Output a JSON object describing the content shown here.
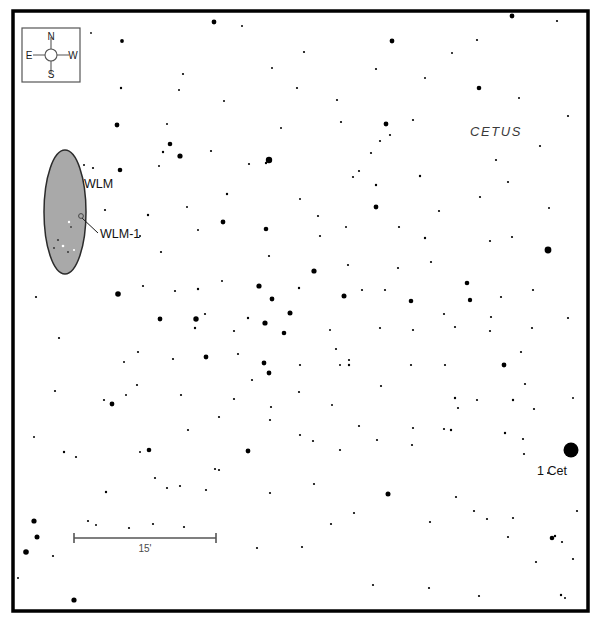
{
  "chart": {
    "type": "star-chart",
    "width": 601,
    "height": 627,
    "background_color": "#ffffff",
    "frame": {
      "x": 13,
      "y": 11,
      "width": 575,
      "height": 600,
      "stroke_color": "#000000",
      "stroke_width": 3.5
    }
  },
  "compass": {
    "box": {
      "x": 22,
      "y": 28,
      "width": 58,
      "height": 54
    },
    "box_stroke": "#555555",
    "center": {
      "x": 51,
      "y": 55
    },
    "circle_radius": 6,
    "arm_color": "#555555",
    "north_label": "N",
    "south_label": "S",
    "east_label": "E",
    "west_label": "W"
  },
  "galaxy": {
    "name_label": "WLM",
    "name_label_pos": {
      "x": 84,
      "y": 188
    },
    "ellipse": {
      "cx": 65,
      "cy": 212,
      "rx": 21,
      "ry": 62
    },
    "fill_color": "#a9a9a9",
    "stroke_color": "#2b2b2b",
    "member": {
      "label": "WLM-1",
      "label_pos": {
        "x": 100,
        "y": 238
      },
      "marker": {
        "cx": 81,
        "cy": 216,
        "r": 2.4
      },
      "leader_line": {
        "x1": 82,
        "y1": 218,
        "x2": 98,
        "y2": 233
      }
    }
  },
  "constellation": {
    "label": "CETUS",
    "pos": {
      "x": 470,
      "y": 136
    },
    "color": "#3a3a3a"
  },
  "named_stars": [
    {
      "label": "1 Cet",
      "label_pos": {
        "x": 537,
        "y": 475
      },
      "marker": {
        "cx": 571,
        "cy": 450,
        "r": 7.5
      }
    }
  ],
  "scale_bar": {
    "label": "15'",
    "x1": 74,
    "x2": 216,
    "y": 538,
    "tick_half_height": 5,
    "stroke_color": "#555555",
    "stroke_width": 1.6,
    "label_pos": {
      "x": 145,
      "y": 552
    }
  },
  "star_field": {
    "color": "#000000",
    "note": "x, y in pixels; r = drawn radius in pixels",
    "stars": [
      {
        "x": 214,
        "y": 22,
        "r": 2.4
      },
      {
        "x": 512,
        "y": 16,
        "r": 2.4
      },
      {
        "x": 557,
        "y": 21,
        "r": 1.1
      },
      {
        "x": 122,
        "y": 41,
        "r": 1.9
      },
      {
        "x": 242,
        "y": 26,
        "r": 1.0
      },
      {
        "x": 304,
        "y": 52,
        "r": 1.1
      },
      {
        "x": 392,
        "y": 41,
        "r": 2.4
      },
      {
        "x": 477,
        "y": 40,
        "r": 1.1
      },
      {
        "x": 91,
        "y": 33,
        "r": 0.9
      },
      {
        "x": 183,
        "y": 74,
        "r": 1.1
      },
      {
        "x": 272,
        "y": 68,
        "r": 1.0
      },
      {
        "x": 376,
        "y": 69,
        "r": 1.1
      },
      {
        "x": 452,
        "y": 53,
        "r": 1.0
      },
      {
        "x": 297,
        "y": 88,
        "r": 1.1
      },
      {
        "x": 479,
        "y": 88,
        "r": 2.3
      },
      {
        "x": 425,
        "y": 78,
        "r": 1.0
      },
      {
        "x": 179,
        "y": 90,
        "r": 1.0
      },
      {
        "x": 121,
        "y": 88,
        "r": 1.2
      },
      {
        "x": 337,
        "y": 100,
        "r": 1.1
      },
      {
        "x": 519,
        "y": 98,
        "r": 1.0
      },
      {
        "x": 224,
        "y": 101,
        "r": 1.0
      },
      {
        "x": 386,
        "y": 124,
        "r": 2.4
      },
      {
        "x": 413,
        "y": 120,
        "r": 1.1
      },
      {
        "x": 390,
        "y": 135,
        "r": 1.1
      },
      {
        "x": 568,
        "y": 116,
        "r": 1.1
      },
      {
        "x": 281,
        "y": 128,
        "r": 1.0
      },
      {
        "x": 341,
        "y": 122,
        "r": 1.1
      },
      {
        "x": 167,
        "y": 124,
        "r": 1.0
      },
      {
        "x": 117,
        "y": 125,
        "r": 2.4
      },
      {
        "x": 170,
        "y": 144,
        "r": 2.3
      },
      {
        "x": 180,
        "y": 156,
        "r": 2.6
      },
      {
        "x": 163,
        "y": 152,
        "r": 1.2
      },
      {
        "x": 211,
        "y": 151,
        "r": 1.1
      },
      {
        "x": 269,
        "y": 160,
        "r": 3.2
      },
      {
        "x": 371,
        "y": 153,
        "r": 1.1
      },
      {
        "x": 380,
        "y": 141,
        "r": 1.1
      },
      {
        "x": 496,
        "y": 160,
        "r": 1.1
      },
      {
        "x": 540,
        "y": 146,
        "r": 1.1
      },
      {
        "x": 353,
        "y": 177,
        "r": 1.1
      },
      {
        "x": 359,
        "y": 171,
        "r": 1.1
      },
      {
        "x": 376,
        "y": 185,
        "r": 1.2
      },
      {
        "x": 420,
        "y": 176,
        "r": 1.2
      },
      {
        "x": 508,
        "y": 182,
        "r": 1.1
      },
      {
        "x": 300,
        "y": 199,
        "r": 1.0
      },
      {
        "x": 227,
        "y": 194,
        "r": 1.2
      },
      {
        "x": 376,
        "y": 207,
        "r": 2.4
      },
      {
        "x": 266,
        "y": 163,
        "r": 1.2
      },
      {
        "x": 249,
        "y": 164,
        "r": 1.1
      },
      {
        "x": 480,
        "y": 197,
        "r": 1.1
      },
      {
        "x": 549,
        "y": 208,
        "r": 1.0
      },
      {
        "x": 93,
        "y": 168,
        "r": 1.1
      },
      {
        "x": 84,
        "y": 165,
        "r": 1.0
      },
      {
        "x": 120,
        "y": 170,
        "r": 2.3
      },
      {
        "x": 159,
        "y": 166,
        "r": 1.0
      },
      {
        "x": 105,
        "y": 210,
        "r": 1.1
      },
      {
        "x": 187,
        "y": 207,
        "r": 1.0
      },
      {
        "x": 148,
        "y": 215,
        "r": 1.2
      },
      {
        "x": 198,
        "y": 230,
        "r": 1.0
      },
      {
        "x": 266,
        "y": 229,
        "r": 2.3
      },
      {
        "x": 320,
        "y": 236,
        "r": 1.1
      },
      {
        "x": 318,
        "y": 216,
        "r": 1.1
      },
      {
        "x": 223,
        "y": 222,
        "r": 2.4
      },
      {
        "x": 346,
        "y": 227,
        "r": 1.0
      },
      {
        "x": 399,
        "y": 227,
        "r": 1.1
      },
      {
        "x": 425,
        "y": 238,
        "r": 1.2
      },
      {
        "x": 548,
        "y": 250,
        "r": 3.4
      },
      {
        "x": 490,
        "y": 241,
        "r": 1.1
      },
      {
        "x": 512,
        "y": 237,
        "r": 1.1
      },
      {
        "x": 269,
        "y": 256,
        "r": 1.1
      },
      {
        "x": 314,
        "y": 271,
        "r": 2.6
      },
      {
        "x": 348,
        "y": 265,
        "r": 1.1
      },
      {
        "x": 398,
        "y": 268,
        "r": 1.1
      },
      {
        "x": 431,
        "y": 262,
        "r": 1.1
      },
      {
        "x": 118,
        "y": 294,
        "r": 2.8
      },
      {
        "x": 143,
        "y": 286,
        "r": 1.1
      },
      {
        "x": 175,
        "y": 291,
        "r": 1.1
      },
      {
        "x": 198,
        "y": 289,
        "r": 1.2
      },
      {
        "x": 222,
        "y": 281,
        "r": 1.0
      },
      {
        "x": 259,
        "y": 286,
        "r": 2.6
      },
      {
        "x": 272,
        "y": 299,
        "r": 2.4
      },
      {
        "x": 299,
        "y": 288,
        "r": 1.2
      },
      {
        "x": 344,
        "y": 296,
        "r": 2.5
      },
      {
        "x": 385,
        "y": 290,
        "r": 1.1
      },
      {
        "x": 411,
        "y": 301,
        "r": 2.3
      },
      {
        "x": 467,
        "y": 283,
        "r": 2.3
      },
      {
        "x": 470,
        "y": 300,
        "r": 2.2
      },
      {
        "x": 501,
        "y": 297,
        "r": 1.1
      },
      {
        "x": 533,
        "y": 290,
        "r": 1.1
      },
      {
        "x": 160,
        "y": 319,
        "r": 2.4
      },
      {
        "x": 205,
        "y": 314,
        "r": 1.1
      },
      {
        "x": 234,
        "y": 331,
        "r": 1.1
      },
      {
        "x": 248,
        "y": 318,
        "r": 1.2
      },
      {
        "x": 265,
        "y": 323,
        "r": 2.6
      },
      {
        "x": 290,
        "y": 313,
        "r": 2.5
      },
      {
        "x": 284,
        "y": 333,
        "r": 2.3
      },
      {
        "x": 330,
        "y": 330,
        "r": 1.0
      },
      {
        "x": 380,
        "y": 328,
        "r": 1.1
      },
      {
        "x": 413,
        "y": 330,
        "r": 1.1
      },
      {
        "x": 444,
        "y": 314,
        "r": 1.1
      },
      {
        "x": 455,
        "y": 327,
        "r": 1.1
      },
      {
        "x": 491,
        "y": 317,
        "r": 1.1
      },
      {
        "x": 532,
        "y": 328,
        "r": 1.1
      },
      {
        "x": 568,
        "y": 318,
        "r": 1.1
      },
      {
        "x": 196,
        "y": 319,
        "r": 2.7
      },
      {
        "x": 195,
        "y": 328,
        "r": 1.2
      },
      {
        "x": 137,
        "y": 385,
        "r": 1.1
      },
      {
        "x": 138,
        "y": 352,
        "r": 1.1
      },
      {
        "x": 173,
        "y": 359,
        "r": 1.1
      },
      {
        "x": 206,
        "y": 357,
        "r": 2.4
      },
      {
        "x": 238,
        "y": 354,
        "r": 1.1
      },
      {
        "x": 264,
        "y": 363,
        "r": 2.4
      },
      {
        "x": 269,
        "y": 373,
        "r": 2.4
      },
      {
        "x": 252,
        "y": 380,
        "r": 1.1
      },
      {
        "x": 300,
        "y": 365,
        "r": 1.1
      },
      {
        "x": 336,
        "y": 349,
        "r": 1.1
      },
      {
        "x": 349,
        "y": 360,
        "r": 1.1
      },
      {
        "x": 411,
        "y": 365,
        "r": 1.1
      },
      {
        "x": 445,
        "y": 365,
        "r": 1.1
      },
      {
        "x": 504,
        "y": 365,
        "r": 2.4
      },
      {
        "x": 521,
        "y": 352,
        "r": 1.1
      },
      {
        "x": 525,
        "y": 384,
        "r": 1.1
      },
      {
        "x": 477,
        "y": 400,
        "r": 1.1
      },
      {
        "x": 455,
        "y": 398,
        "r": 1.2
      },
      {
        "x": 513,
        "y": 400,
        "r": 1.2
      },
      {
        "x": 349,
        "y": 365,
        "r": 1.2
      },
      {
        "x": 104,
        "y": 400,
        "r": 1.1
      },
      {
        "x": 181,
        "y": 395,
        "r": 1.1
      },
      {
        "x": 340,
        "y": 365,
        "r": 1.0
      },
      {
        "x": 381,
        "y": 386,
        "r": 1.1
      },
      {
        "x": 126,
        "y": 395,
        "r": 1.0
      },
      {
        "x": 248,
        "y": 451,
        "r": 2.4
      },
      {
        "x": 215,
        "y": 469,
        "r": 1.1
      },
      {
        "x": 149,
        "y": 450,
        "r": 2.3
      },
      {
        "x": 140,
        "y": 452,
        "r": 1.0
      },
      {
        "x": 188,
        "y": 430,
        "r": 1.1
      },
      {
        "x": 219,
        "y": 417,
        "r": 1.1
      },
      {
        "x": 270,
        "y": 420,
        "r": 1.1
      },
      {
        "x": 300,
        "y": 435,
        "r": 1.1
      },
      {
        "x": 313,
        "y": 441,
        "r": 1.1
      },
      {
        "x": 340,
        "y": 450,
        "r": 1.1
      },
      {
        "x": 359,
        "y": 426,
        "r": 1.1
      },
      {
        "x": 377,
        "y": 440,
        "r": 1.1
      },
      {
        "x": 413,
        "y": 428,
        "r": 1.1
      },
      {
        "x": 412,
        "y": 445,
        "r": 1.1
      },
      {
        "x": 451,
        "y": 430,
        "r": 1.2
      },
      {
        "x": 444,
        "y": 429,
        "r": 1.1
      },
      {
        "x": 505,
        "y": 433,
        "r": 1.2
      },
      {
        "x": 523,
        "y": 439,
        "r": 1.1
      },
      {
        "x": 524,
        "y": 454,
        "r": 1.1
      },
      {
        "x": 458,
        "y": 408,
        "r": 1.1
      },
      {
        "x": 332,
        "y": 405,
        "r": 1.0
      },
      {
        "x": 112,
        "y": 404,
        "r": 2.4
      },
      {
        "x": 34,
        "y": 437,
        "r": 1.0
      },
      {
        "x": 64,
        "y": 452,
        "r": 1.2
      },
      {
        "x": 76,
        "y": 457,
        "r": 1.1
      },
      {
        "x": 106,
        "y": 492,
        "r": 1.2
      },
      {
        "x": 155,
        "y": 478,
        "r": 1.1
      },
      {
        "x": 167,
        "y": 488,
        "r": 1.1
      },
      {
        "x": 180,
        "y": 486,
        "r": 1.1
      },
      {
        "x": 206,
        "y": 490,
        "r": 1.1
      },
      {
        "x": 219,
        "y": 470,
        "r": 1.1
      },
      {
        "x": 270,
        "y": 493,
        "r": 1.1
      },
      {
        "x": 314,
        "y": 484,
        "r": 1.1
      },
      {
        "x": 354,
        "y": 513,
        "r": 1.1
      },
      {
        "x": 331,
        "y": 524,
        "r": 1.1
      },
      {
        "x": 388,
        "y": 494,
        "r": 2.5
      },
      {
        "x": 430,
        "y": 522,
        "r": 1.1
      },
      {
        "x": 456,
        "y": 497,
        "r": 1.1
      },
      {
        "x": 474,
        "y": 511,
        "r": 1.1
      },
      {
        "x": 513,
        "y": 518,
        "r": 1.1
      },
      {
        "x": 552,
        "y": 538,
        "r": 2.3
      },
      {
        "x": 562,
        "y": 542,
        "r": 1.1
      },
      {
        "x": 555,
        "y": 536,
        "r": 1.2
      },
      {
        "x": 508,
        "y": 537,
        "r": 1.1
      },
      {
        "x": 487,
        "y": 519,
        "r": 1.1
      },
      {
        "x": 577,
        "y": 511,
        "r": 1.1
      },
      {
        "x": 34,
        "y": 521,
        "r": 2.6
      },
      {
        "x": 37,
        "y": 537,
        "r": 2.5
      },
      {
        "x": 26,
        "y": 552,
        "r": 2.8
      },
      {
        "x": 53,
        "y": 556,
        "r": 1.1
      },
      {
        "x": 18,
        "y": 578,
        "r": 1.0
      },
      {
        "x": 74,
        "y": 600,
        "r": 2.6
      },
      {
        "x": 168,
        "y": 611,
        "r": 1.1
      },
      {
        "x": 88,
        "y": 521,
        "r": 1.1
      },
      {
        "x": 96,
        "y": 525,
        "r": 1.0
      },
      {
        "x": 129,
        "y": 528,
        "r": 1.1
      },
      {
        "x": 153,
        "y": 524,
        "r": 1.1
      },
      {
        "x": 184,
        "y": 527,
        "r": 1.1
      },
      {
        "x": 257,
        "y": 548,
        "r": 1.1
      },
      {
        "x": 302,
        "y": 547,
        "r": 1.1
      },
      {
        "x": 373,
        "y": 585,
        "r": 1.1
      },
      {
        "x": 429,
        "y": 588,
        "r": 1.1
      },
      {
        "x": 479,
        "y": 596,
        "r": 1.1
      },
      {
        "x": 561,
        "y": 595,
        "r": 1.2
      },
      {
        "x": 565,
        "y": 598,
        "r": 1.0
      },
      {
        "x": 573,
        "y": 559,
        "r": 1.1
      },
      {
        "x": 536,
        "y": 562,
        "r": 1.1
      },
      {
        "x": 548,
        "y": 473,
        "r": 1.0
      },
      {
        "x": 534,
        "y": 409,
        "r": 1.1
      },
      {
        "x": 124,
        "y": 362,
        "r": 1.0
      },
      {
        "x": 55,
        "y": 391,
        "r": 1.1
      },
      {
        "x": 59,
        "y": 338,
        "r": 1.1
      },
      {
        "x": 36,
        "y": 297,
        "r": 1.1
      },
      {
        "x": 234,
        "y": 399,
        "r": 1.1
      },
      {
        "x": 271,
        "y": 407,
        "r": 1.1
      },
      {
        "x": 299,
        "y": 392,
        "r": 1.1
      },
      {
        "x": 362,
        "y": 290,
        "r": 1.1
      },
      {
        "x": 439,
        "y": 211,
        "r": 1.1
      },
      {
        "x": 490,
        "y": 331,
        "r": 1.1
      },
      {
        "x": 573,
        "y": 398,
        "r": 1.0
      },
      {
        "x": 161,
        "y": 252,
        "r": 1.1
      },
      {
        "x": 140,
        "y": 236,
        "r": 1.0
      }
    ]
  },
  "galaxy_inner_stars": [
    {
      "x": 69,
      "y": 222,
      "r": 1.2,
      "color": "#ffffff"
    },
    {
      "x": 71,
      "y": 227,
      "r": 0.9,
      "color": "#3a3a3a"
    },
    {
      "x": 58,
      "y": 240,
      "r": 1.1,
      "color": "#3a3a3a"
    },
    {
      "x": 63,
      "y": 246,
      "r": 1.3,
      "color": "#ffffff"
    },
    {
      "x": 74,
      "y": 250,
      "r": 1.1,
      "color": "#ffffff"
    },
    {
      "x": 54,
      "y": 248,
      "r": 0.9,
      "color": "#2a2a2a"
    },
    {
      "x": 68,
      "y": 252,
      "r": 0.9,
      "color": "#2a2a2a"
    }
  ]
}
